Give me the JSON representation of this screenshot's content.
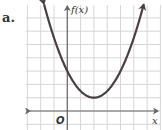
{
  "problem_label": "a.",
  "colors": {
    "curve": "#4a4040",
    "grid": "#d6d6d6",
    "axis": "#666666"
  },
  "chart_data": {
    "type": "line",
    "title": "",
    "xlabel": "x",
    "ylabel": "f(x)",
    "origin_label": "O",
    "function": "f(x) = 0.5(x - 2)^2 + 1",
    "vertex": [
      2,
      1
    ],
    "y_intercept": 3,
    "x": [
      -2,
      -1,
      0,
      1,
      2,
      3,
      4,
      5,
      6
    ],
    "values": [
      9,
      5.5,
      3,
      1.5,
      1,
      1.5,
      3,
      5.5,
      9
    ],
    "xlim": [
      -3,
      7
    ],
    "ylim": [
      -1,
      8
    ],
    "grid": true,
    "arrows": "both ends of curve and x-axis, up arrow on y-axis"
  }
}
